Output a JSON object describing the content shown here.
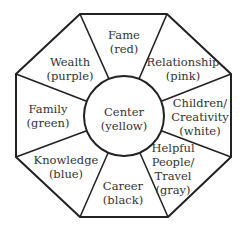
{
  "diagram": {
    "type": "bagua-map",
    "shape": "octagon",
    "center": {
      "label": "Center",
      "color": "(yellow)"
    },
    "sections": [
      {
        "id": "fame",
        "lines": [
          "Fame",
          "(red)"
        ]
      },
      {
        "id": "relationship",
        "lines": [
          "Relationship",
          "(pink)"
        ]
      },
      {
        "id": "children",
        "lines": [
          "Children/",
          "Creativity",
          "(white)"
        ]
      },
      {
        "id": "helpful",
        "lines": [
          "Helpful",
          "People/",
          "Travel",
          "(gray)"
        ]
      },
      {
        "id": "career",
        "lines": [
          "Career",
          "(black)"
        ]
      },
      {
        "id": "knowledge",
        "lines": [
          "Knowledge",
          "(blue)"
        ]
      },
      {
        "id": "family",
        "lines": [
          "Family",
          "(green)"
        ]
      },
      {
        "id": "wealth",
        "lines": [
          "Wealth",
          "(purple)"
        ]
      }
    ]
  }
}
